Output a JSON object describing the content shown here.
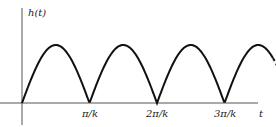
{
  "chart_data": {
    "type": "line",
    "title": "",
    "ylabel": "h(t)",
    "xlabel": "t",
    "x_ticks": [
      "π/k",
      "2π/k",
      "3π/k"
    ],
    "function": "|sin(kt)|",
    "x": [
      0,
      0.5,
      1,
      1.5,
      2,
      2.5,
      3,
      3.5
    ],
    "x_units": "π/k",
    "values": [
      0,
      1,
      0,
      1,
      0,
      1,
      0,
      0.7
    ],
    "grid": false,
    "legend": null,
    "note": "curve continues dashed beyond 3.5π/k"
  },
  "labels": {
    "y_axis": "h(t)",
    "x_axis": "t",
    "tick1": "π/k",
    "tick2": "2π/k",
    "tick3": "3π/k"
  },
  "colors": {
    "curve": "#111111",
    "axis": "#555555"
  }
}
